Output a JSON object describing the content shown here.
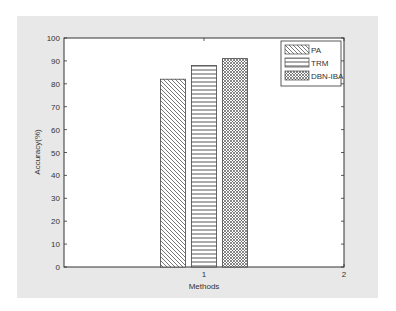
{
  "chart_data": {
    "type": "bar",
    "title": "",
    "xlabel": "Methods",
    "ylabel": "Accuracy(%)",
    "categories": [
      "1"
    ],
    "x_ticks": [
      "1",
      "2"
    ],
    "y_ticks": [
      "0",
      "10",
      "20",
      "30",
      "40",
      "50",
      "60",
      "70",
      "80",
      "90",
      "100"
    ],
    "ylim": [
      0,
      100
    ],
    "xlim": [
      0,
      2
    ],
    "grid": false,
    "legend_position": "top-right",
    "series": [
      {
        "name": "PA",
        "values": [
          82
        ],
        "pattern": "diagonal-hatch"
      },
      {
        "name": "TRM",
        "values": [
          88
        ],
        "pattern": "horizontal-lines"
      },
      {
        "name": "DBN-IBA",
        "values": [
          91
        ],
        "pattern": "crosshatch"
      }
    ]
  }
}
